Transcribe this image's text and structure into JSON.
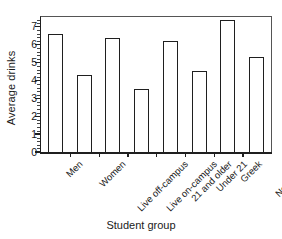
{
  "chart_data": {
    "type": "bar",
    "title": "",
    "xlabel": "Student group",
    "ylabel": "Average drinks",
    "categories": [
      "Men",
      "Women",
      "Live off-campus",
      "Live on-campus",
      "21 and older",
      "Under 21",
      "Greek",
      "Non-Greek"
    ],
    "values": [
      6.6,
      4.3,
      6.35,
      3.5,
      6.2,
      4.55,
      7.35,
      5.3
    ],
    "ylim": [
      0,
      7.6
    ],
    "ytick_labels": [
      "0",
      "1",
      "2",
      "3",
      "4",
      "5",
      "6",
      "7"
    ],
    "ytick_values": [
      0,
      1,
      2,
      3,
      4,
      5,
      6,
      7
    ],
    "minor_ticks_per_interval": 4,
    "grid": false,
    "legend": null,
    "bar_fill": "#ffffff",
    "bar_edge": "#1f1f1f",
    "background": "#ffffff"
  }
}
